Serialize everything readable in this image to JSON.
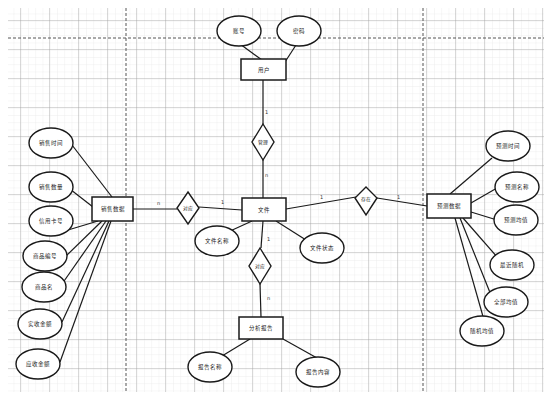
{
  "diagram": {
    "type": "er-diagram",
    "entities": {
      "user": {
        "label": "用户",
        "attributes": [
          "账号",
          "密码"
        ]
      },
      "file": {
        "label": "文件",
        "attributes": [
          "文件名称",
          "文件状态"
        ]
      },
      "sales": {
        "label": "销售数据",
        "attributes": [
          "销售时间",
          "销售数量",
          "信用卡号",
          "商品编号",
          "商品名",
          "实收金额",
          "应收金额"
        ]
      },
      "forecast": {
        "label": "预测数据",
        "attributes": [
          "预测时间",
          "预测名称",
          "预测均值",
          "最近随机",
          "全部均值",
          "随机均值"
        ]
      },
      "report": {
        "label": "分析报告",
        "attributes": [
          "报告名称",
          "报告内容"
        ]
      }
    },
    "relationships": {
      "manage": {
        "label": "管理",
        "from": "用户",
        "to": "文件",
        "card_from": "1",
        "card_to": "n"
      },
      "correspond": {
        "label": "对应",
        "from": "销售数据",
        "to": "文件",
        "card_from": "n",
        "card_to": "1"
      },
      "exist": {
        "label": "存在",
        "from": "文件",
        "to": "预测数据",
        "card_from": "1",
        "card_to": "1"
      },
      "generate": {
        "label": "对应",
        "from": "文件",
        "to": "分析报告",
        "card_from": "1",
        "card_to": "n"
      }
    },
    "colors": {
      "line": "#1a1a1a",
      "grid_minor": "#e3e3e3",
      "grid_major": "#9a9a9a",
      "background": "#ffffff"
    }
  }
}
